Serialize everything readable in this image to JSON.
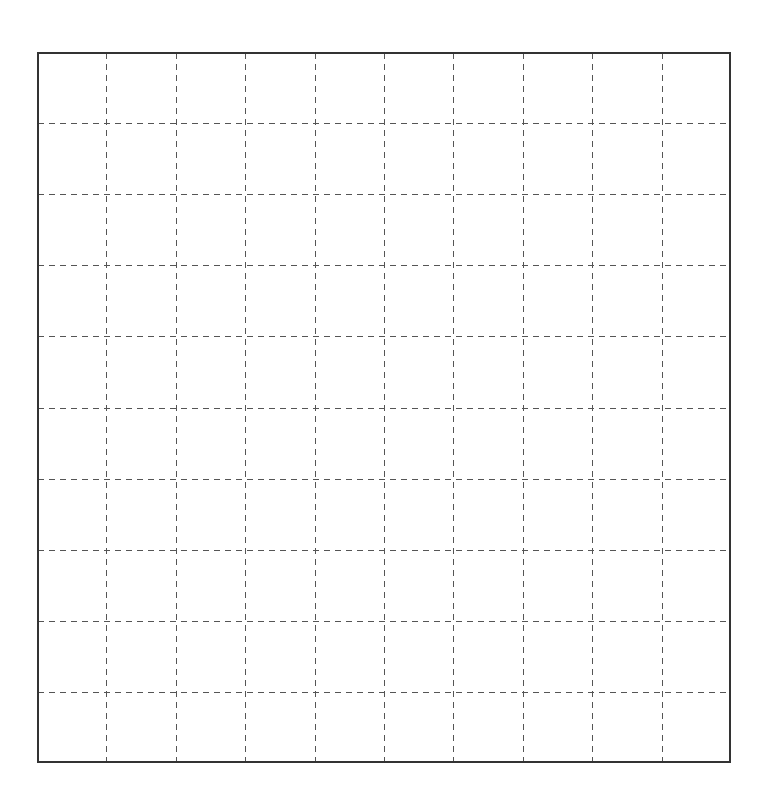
{
  "grid": {
    "rows": 10,
    "columns": 10,
    "border_color": "#333333",
    "border_width": 2,
    "gridline_color": "#555555",
    "gridline_width": 1,
    "gridline_dash": "6,5",
    "background": "#ffffff"
  }
}
